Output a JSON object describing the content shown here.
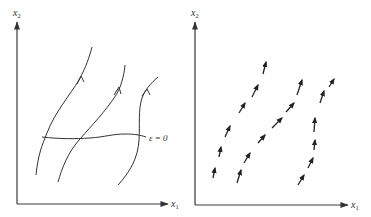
{
  "colors": {
    "ink": "#333333",
    "background": "#ffffff"
  },
  "left_panel": {
    "x_axis_label": "x",
    "x_axis_sub": "1",
    "y_axis_label": "x",
    "y_axis_sub": "2",
    "curve_label": "ε = 0",
    "curve_count": 3,
    "description": "Three trajectories (integral curves) with direction arrows crossing the transversal curve ε = 0"
  },
  "right_panel": {
    "x_axis_label": "x",
    "x_axis_sub": "1",
    "y_axis_label": "x",
    "y_axis_sub": "2",
    "vector_columns": 3,
    "vectors_per_column": 6,
    "description": "Vector field: short arrows tangent to the trajectories"
  }
}
